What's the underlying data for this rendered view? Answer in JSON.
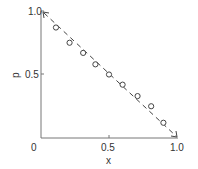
{
  "chart_data": {
    "type": "scatter",
    "title": "",
    "xlabel": "x",
    "ylabel": "p",
    "xlim": [
      0,
      1.0
    ],
    "ylim": [
      0,
      1.0
    ],
    "grid": false,
    "legend": null,
    "x_ticks": [
      "0",
      "0.5",
      "1.0"
    ],
    "y_ticks": [
      "0.5",
      "1.0"
    ],
    "series": [
      {
        "name": "data",
        "marker": "open-circle",
        "x": [
          0.11,
          0.21,
          0.31,
          0.4,
          0.5,
          0.6,
          0.71,
          0.81,
          0.9
        ],
        "y": [
          0.87,
          0.75,
          0.67,
          0.58,
          0.5,
          0.42,
          0.33,
          0.25,
          0.12
        ]
      },
      {
        "name": "p = 1 - x",
        "style": "dashed-line",
        "x": [
          0,
          1.0
        ],
        "y": [
          1.0,
          0
        ]
      }
    ]
  },
  "labels": {
    "origin": "0",
    "x_mid": "0.5",
    "x_max": "1.0",
    "y_mid": "0.5",
    "y_max": "1.0",
    "xlabel": "x",
    "ylabel": "p"
  }
}
